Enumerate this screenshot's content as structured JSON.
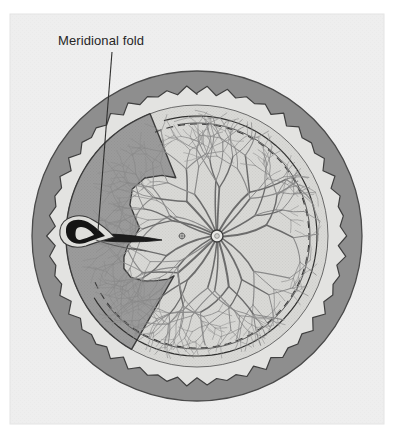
{
  "figure": {
    "domain": "anatomical-illustration",
    "view": "en-face fundus drawing of the posterior globe / retina, left-side periphery highlighted",
    "canvas": {
      "width": 393,
      "height": 437
    },
    "panel": {
      "name": "illustration-panel",
      "x": 10,
      "y": 14,
      "width": 374,
      "height": 410,
      "background_color": "#eeeeee",
      "border_color": "#e2e2e2"
    }
  },
  "annotations": [
    {
      "id": "meridional-fold",
      "label": "Meridional fold",
      "text_color": "#262626",
      "text_x": 58,
      "text_y": 45,
      "font_size": 13,
      "leader": {
        "color": "#30302f",
        "width": 1.1,
        "points": [
          [
            112,
            52
          ],
          [
            98,
            231
          ]
        ]
      }
    }
  ],
  "structures": [
    {
      "id": "sclera-ring",
      "name": "sclera / outer coat ring",
      "color": "#8e8e8e",
      "outline_color": "#4a4a4a",
      "outer_radius": 165,
      "inner_radius": 143,
      "note": "Outer dark-grey annulus; inner edge is scalloped (dentate) around most of the circumference"
    },
    {
      "id": "pars-plana-band",
      "name": "light peripheral band / pars plana",
      "color": "#e3e3e1",
      "outer_radius": 143,
      "inner_radius": 131
    },
    {
      "id": "ora-serrata",
      "name": "ora serrata (dentate / scalloped margin)",
      "color": "#8e8e8e",
      "teeth_count": 46,
      "tooth_depth": 6,
      "note": "Saw-tooth scalloped boundary between sclera ring and the lighter pars plana band"
    },
    {
      "id": "retina",
      "name": "retina (fundus surface)",
      "color": "#d9d9d6",
      "radius": 131
    },
    {
      "id": "detached-crescent",
      "name": "darker peripheral crescent (elevated / folded retina sector)",
      "color": "#9b9b9b",
      "outline_color": "#3c3c3c",
      "sector_from_deg": 120,
      "sector_to_deg": 250
    },
    {
      "id": "equator-line-solid",
      "name": "solid equator arc",
      "color": "#30302f",
      "radius": 120,
      "width": 1.2
    },
    {
      "id": "equator-line-dashed",
      "name": "dashed equator arc",
      "color": "#3a3a3a",
      "radius": 112,
      "width": 1.1,
      "dash": "7 5"
    },
    {
      "id": "optic-disc",
      "name": "optic disc",
      "center_x": 217,
      "center_y": 236,
      "radius": 6,
      "fill": "#e8e8e6",
      "outline_color": "#3a3a3a"
    },
    {
      "id": "fovea",
      "name": "fovea / macula marker",
      "center_x": 182,
      "center_y": 236,
      "radius": 2.6,
      "outline_color": "#5a5a5a"
    },
    {
      "id": "fold-body",
      "name": "meridional fold (dark hook with tapering tail)",
      "color": "#161616",
      "hook_center_x": 75,
      "hook_center_y": 232,
      "tail_tip_x": 160,
      "tail_tip_y": 240
    },
    {
      "id": "retinal-vessels",
      "name": "retinal vessel tree radiating from optic disc",
      "color": "#8a8a8a",
      "color_dark": "#6c6c6c"
    }
  ],
  "colors": {
    "page_background": "#ffffff",
    "panel_background": "#eeeeee",
    "sclera": "#8e8e8e",
    "light_band": "#e3e3e1",
    "retina": "#d9d9d6",
    "crescent": "#9b9b9b",
    "ink": "#30302f",
    "fold_dark": "#161616",
    "vessel": "#8a8a8a"
  }
}
